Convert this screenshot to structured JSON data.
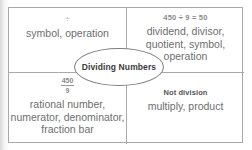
{
  "diagram": {
    "type": "four-quadrant concept map",
    "center": {
      "label": "Dividing Numbers"
    },
    "quadrants": [
      {
        "position": "top-left",
        "example": "÷",
        "terms": "symbol, operation"
      },
      {
        "position": "top-right",
        "example": "450 ÷ 9 = 50",
        "terms": "dividend, divisor, quotient, symbol, operation"
      },
      {
        "position": "bottom-left",
        "example_numerator": "450",
        "example_denominator": "9",
        "terms": "rational number, numerator, denominator, fraction bar"
      },
      {
        "position": "bottom-right",
        "example": "Not division",
        "terms": "multiply, product"
      }
    ]
  },
  "colors": {
    "frame_border": "#a9a9a9",
    "ellipse_border": "#7d7d7d",
    "term_text": "#6e6e6e",
    "example_text": "#8a8a8a",
    "center_text": "#3c3c3c",
    "background": "#ffffff"
  }
}
